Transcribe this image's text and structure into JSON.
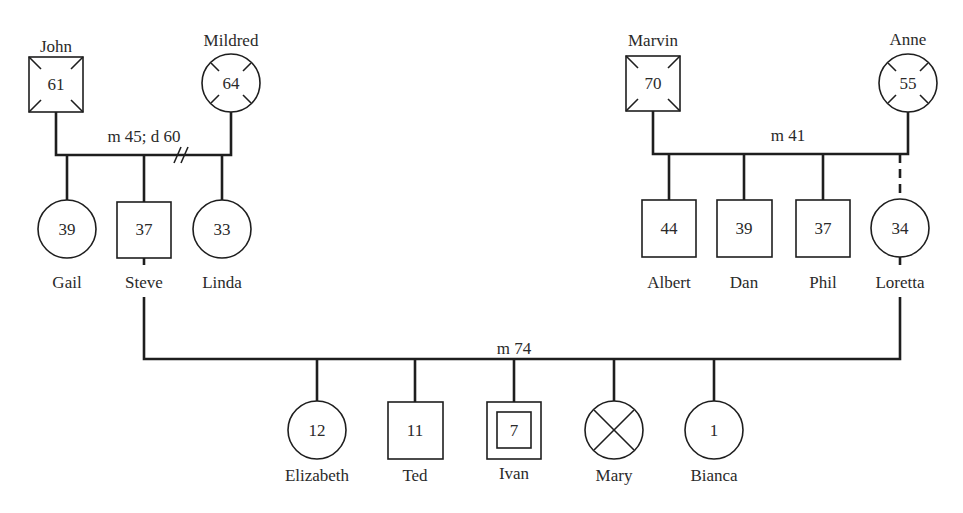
{
  "diagram": {
    "type": "genogram",
    "colors": {
      "ink": "#1e1e1e",
      "background": "#ffffff"
    },
    "people": {
      "john": {
        "name": "John",
        "age": "61",
        "sex": "male",
        "status": "deceased-marked"
      },
      "mildred": {
        "name": "Mildred",
        "age": "64",
        "sex": "female",
        "status": "deceased-marked"
      },
      "marvin": {
        "name": "Marvin",
        "age": "70",
        "sex": "male",
        "status": "deceased-marked"
      },
      "anne": {
        "name": "Anne",
        "age": "55",
        "sex": "female",
        "status": "deceased-marked"
      },
      "gail": {
        "name": "Gail",
        "age": "39",
        "sex": "female"
      },
      "steve": {
        "name": "Steve",
        "age": "37",
        "sex": "male"
      },
      "linda": {
        "name": "Linda",
        "age": "33",
        "sex": "female"
      },
      "albert": {
        "name": "Albert",
        "age": "44",
        "sex": "male"
      },
      "dan": {
        "name": "Dan",
        "age": "39",
        "sex": "male"
      },
      "phil": {
        "name": "Phil",
        "age": "37",
        "sex": "male"
      },
      "loretta": {
        "name": "Loretta",
        "age": "34",
        "sex": "female",
        "note": "adopted (dashed line)"
      },
      "elizabeth": {
        "name": "Elizabeth",
        "age": "12",
        "sex": "female"
      },
      "ted": {
        "name": "Ted",
        "age": "11",
        "sex": "male"
      },
      "ivan": {
        "name": "Ivan",
        "age": "7",
        "sex": "male",
        "status": "identified-patient"
      },
      "mary": {
        "name": "Mary",
        "age": "",
        "sex": "female",
        "status": "deceased (X)"
      },
      "bianca": {
        "name": "Bianca",
        "age": "1",
        "sex": "female"
      }
    },
    "relationships": {
      "john_mildred": {
        "label": "m 45; d 60",
        "type": "divorced"
      },
      "marvin_anne": {
        "label": "m 41",
        "type": "married"
      },
      "steve_loretta": {
        "label": "m 74",
        "type": "married"
      }
    }
  }
}
